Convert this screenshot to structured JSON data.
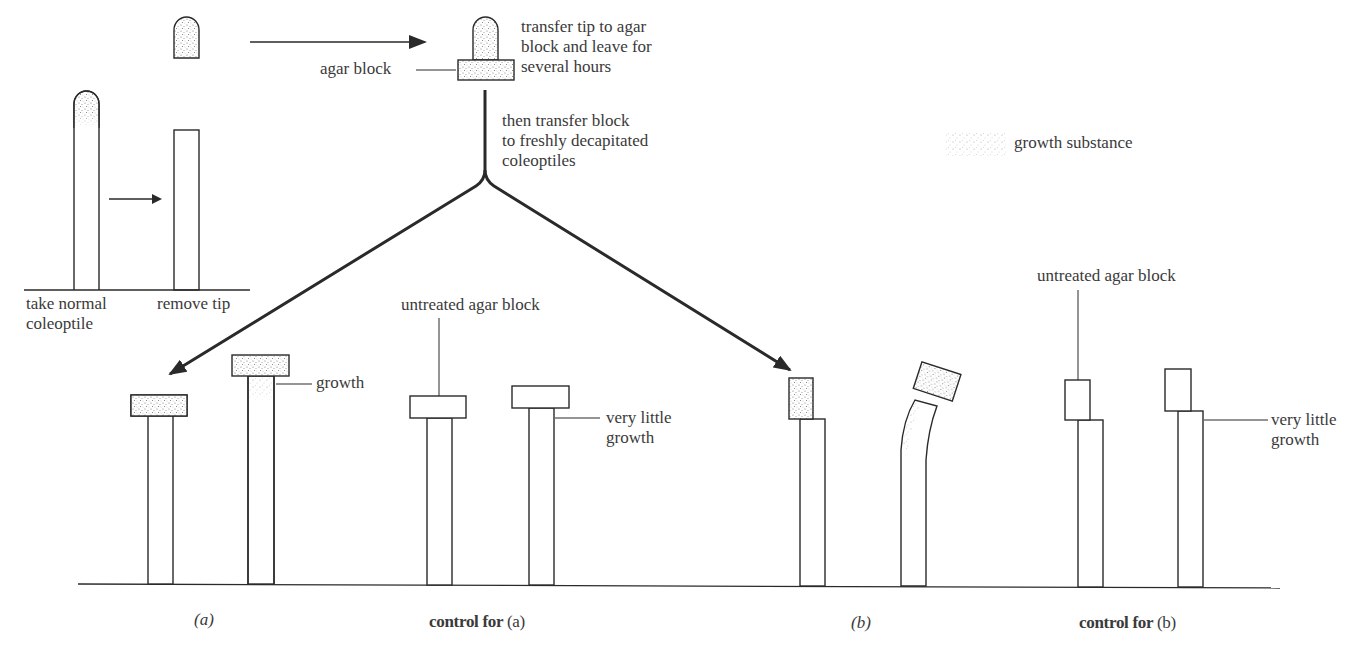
{
  "legend": {
    "swatch": "stippled-pattern",
    "label": "growth substance"
  },
  "top": {
    "step1_label_line1": "take normal",
    "step1_label_line2": "coleoptile",
    "step2_label": "remove tip",
    "agar_label": "agar block",
    "transfer_line1": "transfer tip to agar",
    "transfer_line2": "block and leave for",
    "transfer_line3": "several hours",
    "then_line1": "then transfer block",
    "then_line2": "to freshly decapitated",
    "then_line3": "coleoptiles"
  },
  "bottom": {
    "growth_label": "growth",
    "untreated_a": "untreated agar block",
    "very_little_a_1": "very little",
    "very_little_a_2": "growth",
    "untreated_b": "untreated agar block",
    "very_little_b_1": "very little",
    "very_little_b_2": "growth"
  },
  "captions": {
    "a": "(a)",
    "control_a_bold": "control for",
    "control_a_tag": "(a)",
    "b": "(b)",
    "control_b_bold": "control for",
    "control_b_tag": "(b)"
  },
  "colors": {
    "line": "#2a2a2a",
    "text": "#3a3a3a",
    "stipple": "#8a8a8a"
  }
}
